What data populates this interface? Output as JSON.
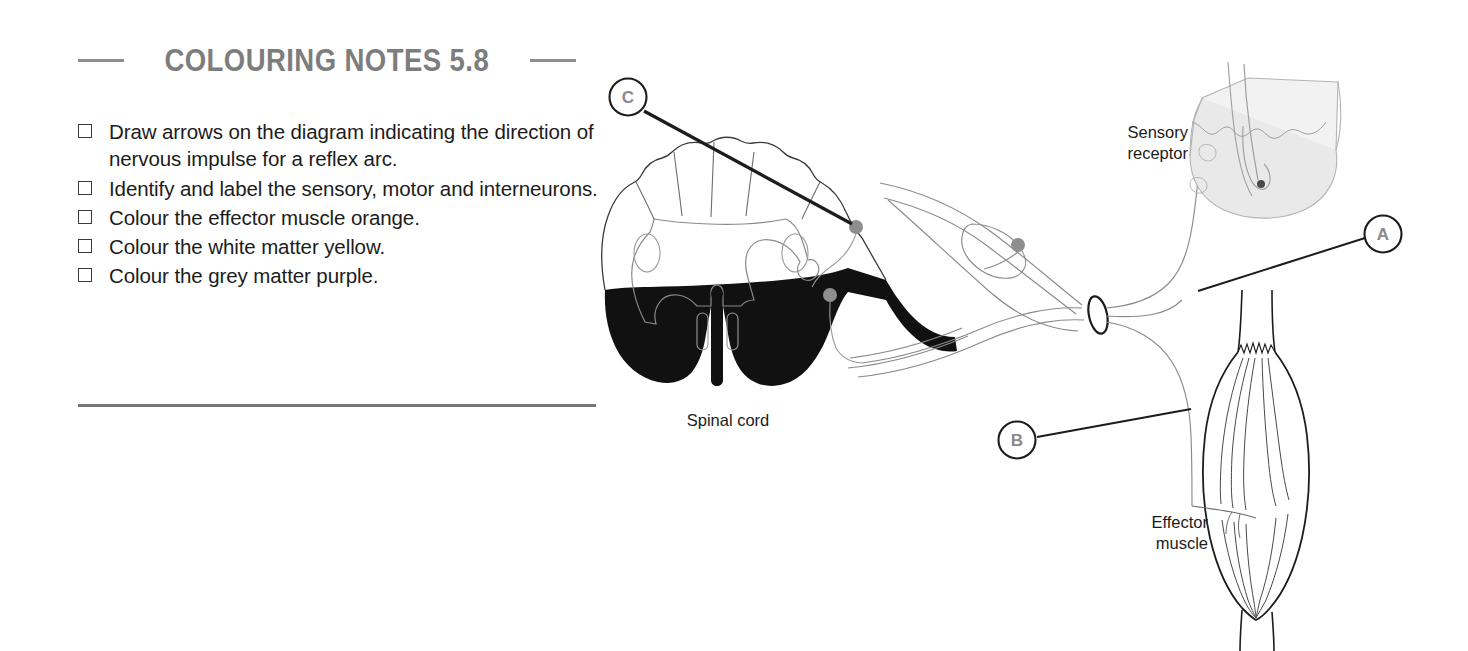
{
  "notes": {
    "title": "Colouring Notes 5.8",
    "items": [
      {
        "label": "Draw arrows on the diagram indicating the direction of nervous impulse for a reflex arc."
      },
      {
        "label": "Identify and label the sensory, motor and interneurons."
      },
      {
        "label": "Colour the effector muscle orange."
      },
      {
        "label": "Colour the white matter yellow."
      },
      {
        "label": "Colour the grey matter purple."
      }
    ]
  },
  "diagram": {
    "labels": {
      "sensory_receptor": "Sensory\nreceptor",
      "spinal_cord": "Spinal cord",
      "effector_muscle": "Effector\nmuscle"
    },
    "markers": [
      {
        "id": "A",
        "letter": "A",
        "cx": 1383,
        "cy": 234
      },
      {
        "id": "B",
        "letter": "B",
        "cx": 1017,
        "cy": 440
      },
      {
        "id": "C",
        "letter": "C",
        "cx": 628,
        "cy": 97
      }
    ],
    "colors": {
      "ink": "#1c1c1c",
      "line_light": "#888888",
      "line_faint": "#aaaaaa",
      "white_matter_fill": "#ffffff",
      "ventral_black": "#111111",
      "neuron_dot": "#8e8e8e",
      "skin_fill": "#e4e4e4",
      "title_grey": "#7d7d7d"
    }
  }
}
